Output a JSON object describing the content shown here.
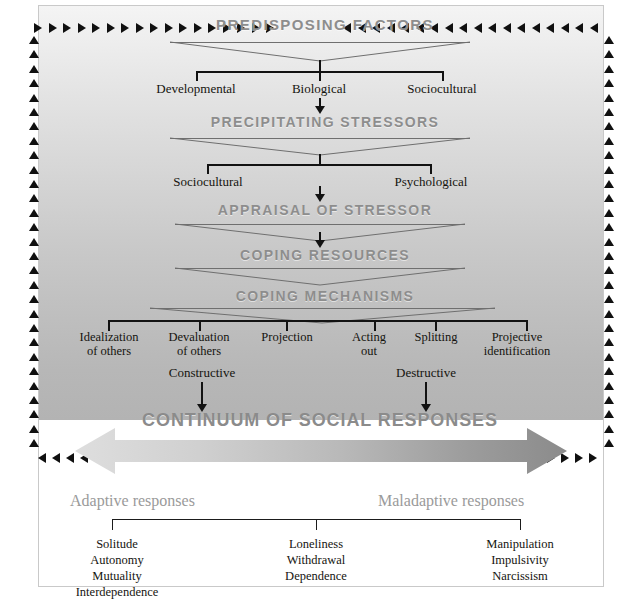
{
  "diagram": {
    "colors": {
      "heading_gray": "#8d8d8d",
      "text_black": "#15140f",
      "arrow_light": "#d5d5d5",
      "arrow_dark": "#8f8f8f",
      "panel_top": "#f4f4f4",
      "panel_bottom": "#b3b3b3"
    },
    "stages": [
      {
        "id": "predisposing",
        "heading": "PREDISPOSING FACTORS"
      },
      {
        "id": "precipitating",
        "heading": "PRECIPITATING STRESSORS"
      },
      {
        "id": "appraisal",
        "heading": "APPRAISAL OF STRESSOR"
      },
      {
        "id": "resources",
        "heading": "COPING RESOURCES"
      },
      {
        "id": "mechanisms",
        "heading": "COPING MECHANISMS"
      }
    ],
    "predisposing_factors": [
      "Developmental",
      "Biological",
      "Sociocultural"
    ],
    "precipitating_stressors": [
      "Sociocultural",
      "Psychological"
    ],
    "coping_mechanisms": [
      {
        "line1": "Idealization",
        "line2": "of others"
      },
      {
        "line1": "Devaluation",
        "line2": "of others"
      },
      {
        "line1": "Projection",
        "line2": ""
      },
      {
        "line1": "Acting",
        "line2": "out"
      },
      {
        "line1": "Splitting",
        "line2": ""
      },
      {
        "line1": "Projective",
        "line2": "identification"
      }
    ],
    "valence_labels": [
      "Constructive",
      "Destructive"
    ],
    "continuum": {
      "title": "CONTINUUM OF SOCIAL RESPONSES",
      "left_heading": "Adaptive responses",
      "right_heading": "Maladaptive responses",
      "groups": [
        {
          "items": [
            "Solitude",
            "Autonomy",
            "Mutuality",
            "Interdependence"
          ]
        },
        {
          "items": [
            "Loneliness",
            "Withdrawal",
            "Dependence"
          ]
        },
        {
          "items": [
            "Manipulation",
            "Impulsivity",
            "Narcissism"
          ]
        }
      ]
    },
    "feedback_loop": {
      "name": "feedback-arrow-border",
      "top_left_glyph": "▶",
      "top_right_glyph": "◀",
      "side_glyph": "▲"
    }
  }
}
